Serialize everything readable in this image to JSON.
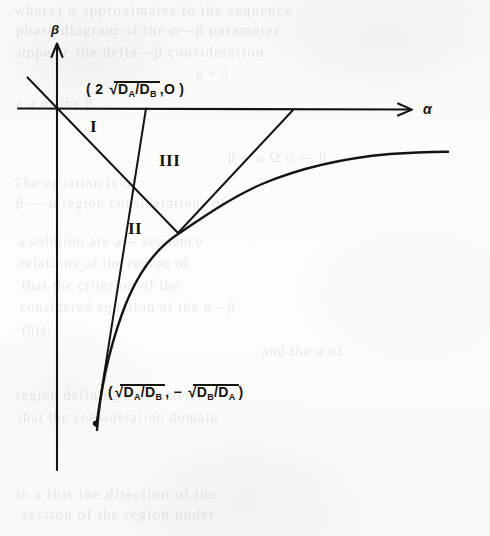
{
  "figure": {
    "kind": "mathematical-phase-diagram",
    "background_color": "#fbfbfa",
    "ink_color": "#16140f",
    "axes": {
      "vertical_label": "β",
      "horizontal_label": "α",
      "origin_px": [
        57,
        108
      ]
    },
    "regions": [
      {
        "id": "region-1",
        "label": "I"
      },
      {
        "id": "region-2",
        "label": "II"
      },
      {
        "id": "region-3",
        "label": "III"
      }
    ],
    "coordinate_labels": {
      "upper": {
        "open_paren": "(",
        "coefficient": "2",
        "radical_sign": "√",
        "numerator": "D",
        "numerator_sub": "A",
        "slash": "/",
        "denominator": "D",
        "denominator_sub": "B",
        "comma": ",",
        "second_component": "O",
        "close_paren": ")",
        "plain_text": "( 2 √(D_A / D_B) , O )"
      },
      "lower": {
        "open_paren": "(",
        "first_radical": "√",
        "first_numerator": "D",
        "first_numerator_sub": "A",
        "first_slash": "/",
        "first_denominator": "D",
        "first_denominator_sub": "B",
        "comma": ",",
        "minus": "−",
        "second_radical": "√",
        "second_numerator": "D",
        "second_numerator_sub": "B",
        "second_slash": "/",
        "second_denominator": "D",
        "second_denominator_sub": "A",
        "close_paren": ")",
        "plain_text": "( √(D_A / D_B) , − √(D_B / D_A) )"
      }
    }
  },
  "bleed_through": {
    "note": "faint mirrored text showing through from the reverse side of the scanned page",
    "lines": [
      {
        "text": "where)  α  approximates to the sequence",
        "x": 14,
        "y": 2,
        "size": 15
      },
      {
        "text": "phase diagram of the   α—β  parameter",
        "x": 16,
        "y": 22,
        "size": 15
      },
      {
        "text": "upper  c  the delta—β consideration",
        "x": 18,
        "y": 44,
        "size": 15
      },
      {
        "text": "β  =  0",
        "x": 196,
        "y": 66,
        "size": 13
      },
      {
        "text": "a  α  of  the  β",
        "x": 16,
        "y": 96,
        "size": 14
      },
      {
        "text": "β— α          Ω         α — β",
        "x": 228,
        "y": 150,
        "size": 14
      },
      {
        "text": "The  equation  is  of",
        "x": 14,
        "y": 176,
        "size": 14
      },
      {
        "text": "β — α  region  considerations  of",
        "x": 16,
        "y": 196,
        "size": 14
      },
      {
        "text": "a  solution  are  a— sequence",
        "x": 18,
        "y": 234,
        "size": 14
      },
      {
        "text": "relations   of  the  region  of",
        "x": 20,
        "y": 256,
        "size": 14
      },
      {
        "text": "that  the  criterion  of  the",
        "x": 22,
        "y": 278,
        "size": 14
      },
      {
        "text": "considered  equation   of  the  α—β",
        "x": 20,
        "y": 300,
        "size": 14
      },
      {
        "text": "this.",
        "x": 22,
        "y": 322,
        "size": 14
      },
      {
        "text": "and  the  α  of",
        "x": 262,
        "y": 344,
        "size": 14
      },
      {
        "text": "region  defining  a  parameter",
        "x": 16,
        "y": 388,
        "size": 14
      },
      {
        "text": "that  the  consideration  domain",
        "x": 18,
        "y": 410,
        "size": 14
      },
      {
        "text": "in  a  this  the  direction  of  the",
        "x": 16,
        "y": 486,
        "size": 15
      },
      {
        "text": "section  of  the  region  under",
        "x": 22,
        "y": 506,
        "size": 15
      }
    ]
  }
}
